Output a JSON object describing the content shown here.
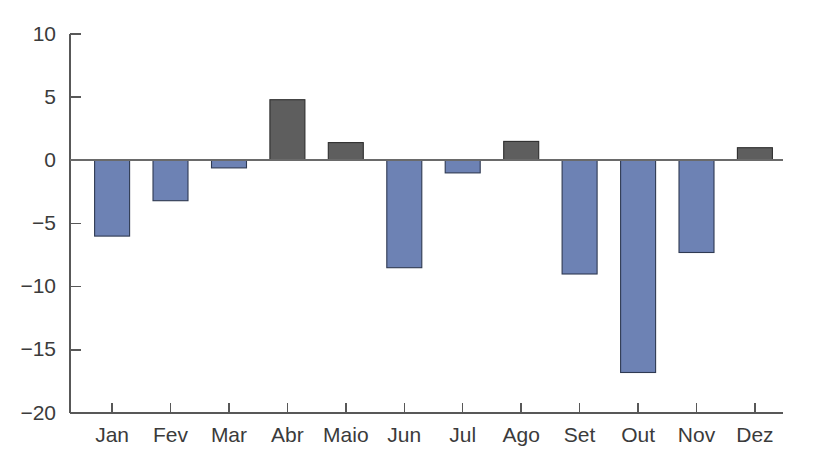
{
  "chart_data": {
    "type": "bar",
    "title": "",
    "subtitle": "",
    "xlabel": "",
    "ylabel": "",
    "categories": [
      "Jan",
      "Fev",
      "Mar",
      "Abr",
      "Maio",
      "Jun",
      "Jul",
      "Ago",
      "Set",
      "Out",
      "Nov",
      "Dez"
    ],
    "values": [
      -6.0,
      -3.2,
      -0.6,
      4.8,
      1.4,
      -8.5,
      -1.0,
      1.5,
      -9.0,
      -16.8,
      -7.3,
      1.0
    ],
    "series": [
      {
        "name": "Variação mensal",
        "values": [
          -6.0,
          -3.2,
          -0.6,
          4.8,
          1.4,
          -8.5,
          -1.0,
          1.5,
          -9.0,
          -16.8,
          -7.3,
          1.0
        ]
      }
    ],
    "ylim": [
      -20,
      10
    ],
    "yticks": [
      10,
      5,
      0,
      -5,
      -10,
      -15,
      -20
    ],
    "ytick_labels": [
      "10",
      "5",
      "0",
      "−5",
      "−10",
      "−15",
      "−20"
    ],
    "xtick_labels": [
      "Jan",
      "Fev",
      "Mar",
      "Abr",
      "Maio",
      "Jun",
      "Jul",
      "Ago",
      "Set",
      "Out",
      "Nov",
      "Dez"
    ],
    "grid": false,
    "legend": false,
    "legend_position": "none",
    "annotations": [],
    "colors": {
      "positive_bar": "#5e5e5e",
      "positive_bar_edge": "#2e2e2e",
      "negative_bar": "#6d82b4",
      "negative_bar_edge": "#2f3a52",
      "axis": "#585858",
      "zero_line": "#6a6a6a",
      "text": "#3b3b3b",
      "background": "#ffffff"
    }
  }
}
